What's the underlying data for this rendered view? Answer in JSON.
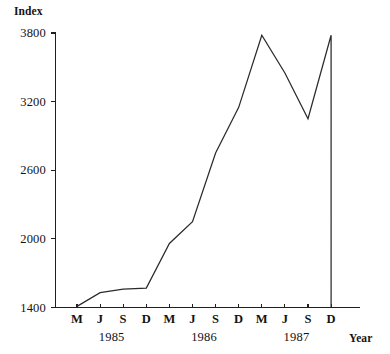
{
  "chart_data": {
    "type": "line",
    "title": "",
    "subtitle": "",
    "xlabel": "Year",
    "ylabel": "Index",
    "grid": false,
    "legend": "none",
    "ylim": [
      1400,
      3800
    ],
    "yticks": [
      1400,
      2000,
      2600,
      3200,
      3800
    ],
    "ytick_labels": [
      "1400",
      "2000",
      "2600",
      "3200",
      "3800"
    ],
    "x": [
      "M",
      "J",
      "S",
      "D",
      "M",
      "J",
      "S",
      "D",
      "M",
      "J",
      "S",
      "D"
    ],
    "xtick_labels": [
      "M",
      "J",
      "S",
      "D",
      "M",
      "J",
      "S",
      "D",
      "M",
      "J",
      "S",
      "D"
    ],
    "x_group_labels": [
      "1985",
      "1986",
      "1987"
    ],
    "x_full_labels": [
      "M 1985",
      "J 1985",
      "S 1985",
      "D 1985",
      "M 1986",
      "J 1986",
      "S 1986",
      "D 1986",
      "M 1987",
      "J 1987",
      "S 1987",
      "D 1987"
    ],
    "values": [
      1410,
      1530,
      1560,
      1570,
      1960,
      2150,
      2750,
      3150,
      3780,
      3450,
      3050,
      3780
    ],
    "final_drop_value": 1400,
    "series": [
      {
        "name": "Index",
        "values": [
          1410,
          1530,
          1560,
          1570,
          1960,
          2150,
          2750,
          3150,
          3780,
          3450,
          3050,
          3780
        ]
      }
    ],
    "annotations": []
  },
  "axes": {
    "y_title": "Index",
    "x_title": "Year"
  },
  "colors": {
    "line": "#2b2b2b",
    "axis": "#1f1f1f",
    "background": "#ffffff",
    "text": "#131313"
  }
}
